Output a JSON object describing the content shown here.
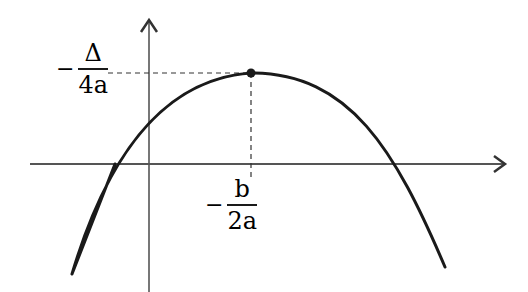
{
  "diagram": {
    "curve": {
      "type": "downward parabola",
      "color": "#1a1a1a"
    },
    "axes": {
      "x_axis": "horizontal arrow",
      "y_axis": "vertical arrow"
    },
    "vertex": {
      "label": "vertex point"
    },
    "labels": {
      "y_vertex": {
        "sign": "−",
        "numerator": "Δ",
        "denominator": "4a"
      },
      "x_vertex": {
        "sign": "−",
        "numerator": "b",
        "denominator": "2a"
      }
    }
  },
  "colors": {
    "ink": "#1a1a1a",
    "background": "#ffffff",
    "axis": "#555555"
  }
}
